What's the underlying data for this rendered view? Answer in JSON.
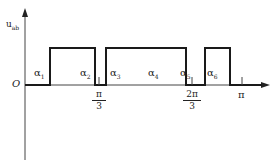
{
  "diagram": {
    "y_axis_label": "u",
    "y_axis_subscript": "ab",
    "origin_label": "O",
    "x_end_label": "π",
    "alphas": [
      {
        "label": "α",
        "sub": "1"
      },
      {
        "label": "α",
        "sub": "2"
      },
      {
        "label": "α",
        "sub": "3"
      },
      {
        "label": "α",
        "sub": "4"
      },
      {
        "label": "α",
        "sub": "5"
      },
      {
        "label": "α",
        "sub": "6"
      }
    ],
    "ticks": [
      {
        "num": "π",
        "den": "3"
      },
      {
        "num": "2π",
        "den": "3"
      }
    ],
    "pulses": [
      {
        "start_x": 50,
        "end_x": 95
      },
      {
        "start_x": 106,
        "end_x": 186
      },
      {
        "start_x": 205,
        "end_x": 230
      }
    ],
    "line_color": "#1a1a1a"
  }
}
